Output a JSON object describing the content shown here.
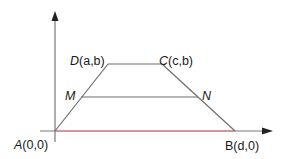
{
  "diagram": {
    "type": "trapezoid-on-axes",
    "colors": {
      "axis": "#777777",
      "shape": "#6e6e6e",
      "base_segment": "#d98a94",
      "text": "#1a1a1a",
      "background": "#ffffff"
    },
    "points": {
      "A": {
        "label": "A(0,0)",
        "name": "A",
        "coords": "(0,0)",
        "x": 55,
        "y": 131
      },
      "B": {
        "label": "B(d,0)",
        "name": "B",
        "coords": "(d,0)",
        "x": 235,
        "y": 131
      },
      "C": {
        "label": "C(c,b)",
        "name": "C",
        "coords": "(c,b)",
        "x": 162,
        "y": 64
      },
      "D": {
        "label": "D(a,b)",
        "name": "D",
        "coords": "(a,b)",
        "x": 108,
        "y": 64
      },
      "M": {
        "label": "M",
        "x": 82,
        "y": 96
      },
      "N": {
        "label": "N",
        "x": 199,
        "y": 96
      }
    },
    "axes": {
      "x_axis": {
        "from_x": 40,
        "to_x": 272,
        "y": 131
      },
      "y_axis": {
        "x": 55,
        "from_y": 142,
        "to_y": 12
      }
    },
    "segments": [
      {
        "from": "A",
        "to": "D"
      },
      {
        "from": "D",
        "to": "C"
      },
      {
        "from": "C",
        "to": "B"
      },
      {
        "from": "M",
        "to": "N"
      },
      {
        "from": "A",
        "to": "B",
        "highlight": true
      }
    ]
  }
}
